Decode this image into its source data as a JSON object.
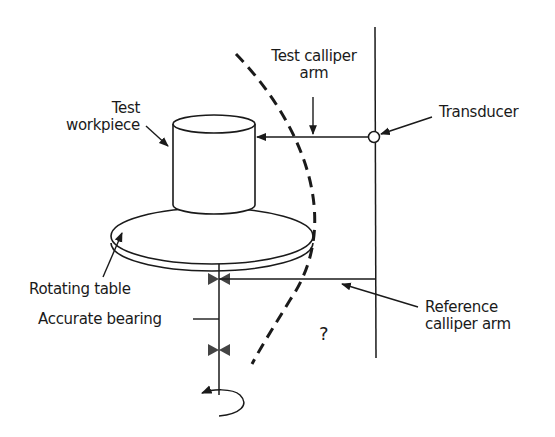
{
  "diagram": {
    "type": "roundness measurement setup (rotating table)",
    "labels": {
      "test_workpiece_line1": "Test",
      "test_workpiece_line2": "workpiece",
      "test_calliper_line1": "Test calliper",
      "test_calliper_line2": "arm",
      "transducer": "Transducer",
      "rotating_table": "Rotating table",
      "accurate_bearing": "Accurate bearing",
      "reference_calliper_line1": "Reference",
      "reference_calliper_line2": "calliper arm",
      "question_mark": "?"
    },
    "components": [
      "test-workpiece (cylinder)",
      "rotating-table (disc)",
      "spindle shaft with two accurate bearings",
      "rotation arrow",
      "vertical reference column",
      "transducer",
      "test calliper arm",
      "reference calliper arm",
      "dashed arc"
    ],
    "colors": {
      "stroke": "#1a1a1a",
      "background": "#ffffff"
    }
  }
}
